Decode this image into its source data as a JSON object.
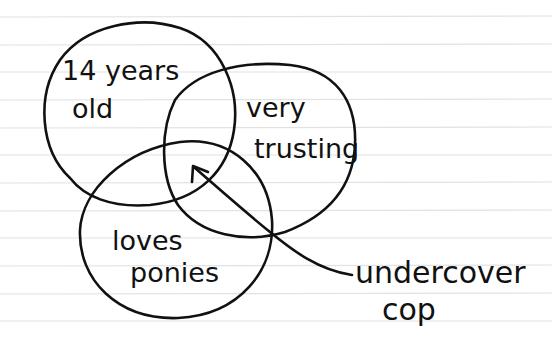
{
  "diagram": {
    "type": "venn",
    "sets": [
      {
        "id": "a",
        "label_line1": "14 years",
        "label_line2": "old"
      },
      {
        "id": "b",
        "label_line1": "very",
        "label_line2": "trusting"
      },
      {
        "id": "c",
        "label_line1": "loves",
        "label_line2": "ponies"
      }
    ],
    "annotation": {
      "label_line1": "undercover",
      "label_line2": "cop",
      "points_to": "intersection of all three sets"
    }
  },
  "style": {
    "ink_color": "#111111",
    "paper_color": "#ffffff",
    "rule_color": "#e2e2e2"
  }
}
